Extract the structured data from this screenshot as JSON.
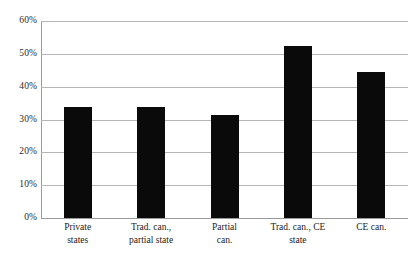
{
  "chart_data": {
    "type": "bar",
    "title": "",
    "subtitle": "",
    "xlabel": "",
    "ylabel": "",
    "categories": [
      "Private states",
      "Trad. can., partial state",
      "Partial can.",
      "Trad. can., CE state",
      "CE can."
    ],
    "category_lines": [
      [
        "Private",
        "states"
      ],
      [
        "Trad. can.,",
        "partial state"
      ],
      [
        "Partial",
        "can."
      ],
      [
        "Trad. can., CE",
        "state"
      ],
      [
        "CE can."
      ]
    ],
    "values": [
      33.8,
      33.8,
      31.3,
      52.3,
      44.5
    ],
    "ylim": [
      0,
      60
    ],
    "ytick_labels": [
      "0%",
      "10%",
      "20%",
      "30%",
      "40%",
      "50%",
      "60%"
    ],
    "ytick_values": [
      0,
      10,
      20,
      30,
      40,
      50,
      60
    ],
    "grid": true,
    "legend": "none",
    "bar_color": "#0a0a0a",
    "grid_color": "#b5b5b5",
    "axis_color": "#9a9a9a"
  }
}
